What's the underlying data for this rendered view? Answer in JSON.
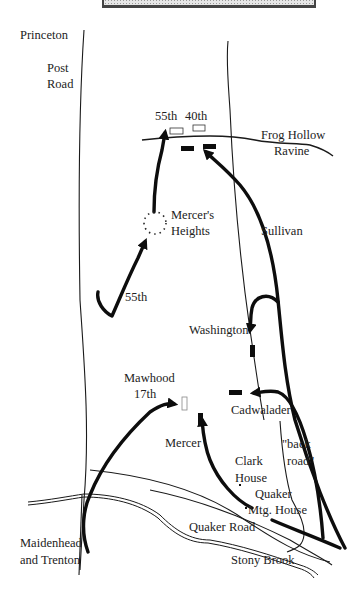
{
  "title_banner": {
    "fill": "#d9d9d9",
    "border": "#444444"
  },
  "labels": {
    "princeton": "Princeton",
    "post": "Post",
    "road": "Road",
    "r55_top": "55th",
    "r40_top": "40th",
    "frog_hollow": "Frog Hollow",
    "ravine": "Ravine",
    "mercers": "Mercer's",
    "heights": "Heights",
    "sullivan": "Sullivan",
    "r55_mid": "55th",
    "washington": "Washington",
    "mawhood": "Mawhood",
    "r17th": "17th",
    "cadwalader": "Cadwalader",
    "mercer": "Mercer",
    "back": "\"back",
    "back_road": "road\"",
    "clark": "Clark",
    "house": "House",
    "quaker": "Quaker",
    "mtg_house": "Mtg. House",
    "quaker_road": "Quaker Road",
    "maidenhead": "Maidenhead",
    "and_trenton": "and Trenton",
    "stony_brook": "Stony Brook"
  },
  "legend": {
    "british_unit": "hollow rectangle",
    "american_unit": "solid rectangle",
    "movement": "thick arrow"
  },
  "colors": {
    "ink": "#111111",
    "background": "#ffffff"
  }
}
